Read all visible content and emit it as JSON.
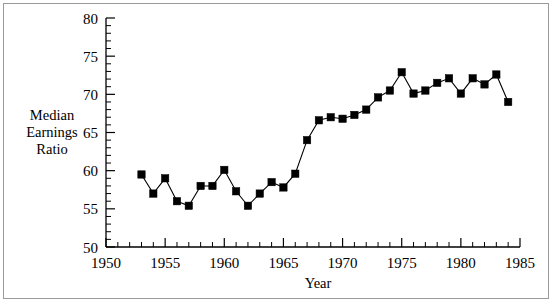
{
  "figure": {
    "background_color": "#ffffff",
    "border_color": "#9a9a9a",
    "line_color": "#000000",
    "marker_color": "#000000"
  },
  "labels": {
    "y_axis_title_line1": "Median",
    "y_axis_title_line2": "Earnings",
    "y_axis_title_line3": "Ratio",
    "x_axis_title": "Year"
  },
  "chart_data": {
    "type": "line",
    "title": "",
    "xlabel": "Year",
    "ylabel": "Median Earnings Ratio",
    "xlim": [
      1950,
      1985
    ],
    "ylim": [
      50,
      80
    ],
    "x_major_ticks": [
      1950,
      1955,
      1960,
      1965,
      1970,
      1975,
      1980,
      1985
    ],
    "x_major_tick_labels": [
      "1950",
      "1955",
      "1960",
      "1965",
      "1970",
      "1975",
      "1980",
      "1985"
    ],
    "x_minor_tick_interval": 1,
    "y_major_ticks": [
      50,
      55,
      60,
      65,
      70,
      75,
      80
    ],
    "y_major_tick_labels": [
      "50",
      "55",
      "60",
      "65",
      "70",
      "75",
      "80"
    ],
    "y_minor_tick_interval": 1,
    "grid": false,
    "legend": false,
    "marker": "square",
    "x": [
      1953,
      1954,
      1955,
      1956,
      1957,
      1958,
      1959,
      1960,
      1961,
      1962,
      1963,
      1964,
      1965,
      1966,
      1967,
      1968,
      1969,
      1970,
      1971,
      1972,
      1973,
      1974,
      1975,
      1976,
      1977,
      1978,
      1979,
      1980,
      1981,
      1982,
      1983,
      1984
    ],
    "values": [
      59.5,
      57.0,
      59.0,
      56.0,
      55.4,
      58.0,
      58.0,
      60.1,
      57.3,
      55.4,
      57.0,
      58.5,
      57.8,
      59.6,
      64.0,
      66.6,
      67.0,
      66.8,
      67.3,
      68.0,
      69.6,
      70.5,
      72.9,
      70.1,
      70.5,
      71.5,
      72.1,
      70.1,
      72.1,
      71.3,
      72.6,
      69.0
    ]
  }
}
